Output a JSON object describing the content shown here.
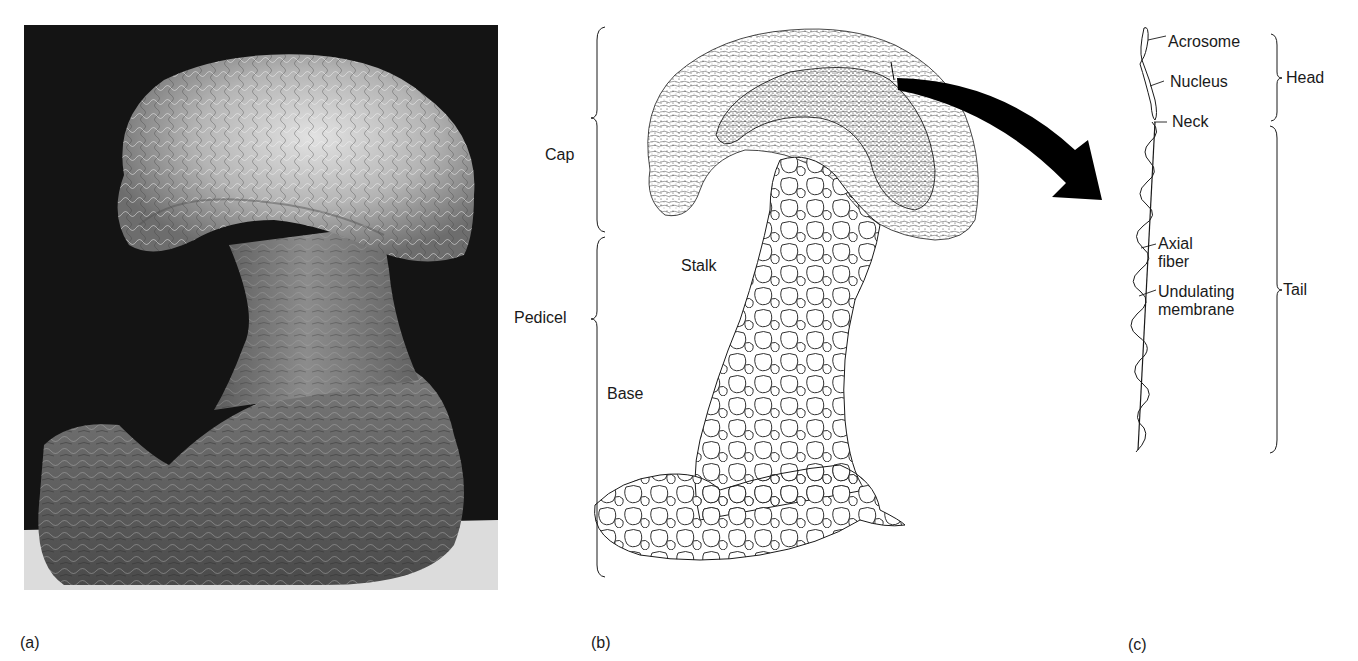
{
  "figure": {
    "panels": [
      {
        "id": "a",
        "letter": "(a)",
        "kind": "scanning electron micrograph",
        "colors": {
          "background": "#141414",
          "specimen_light": "#d8d8d8",
          "specimen_mid": "#8a8a8a",
          "substrate": "#e6e6e6"
        }
      },
      {
        "id": "b",
        "letter": "(b)",
        "kind": "line drawing",
        "bracket_labels": [
          {
            "label": "Cap"
          },
          {
            "label": "Pedicel"
          }
        ],
        "part_labels": [
          {
            "label": "Stalk"
          },
          {
            "label": "Base"
          }
        ]
      },
      {
        "id": "c",
        "letter": "(c)",
        "kind": "line drawing",
        "part_labels": [
          {
            "label": "Acrosome"
          },
          {
            "label": "Nucleus"
          },
          {
            "label": "Neck"
          },
          {
            "label": "Axial fiber",
            "lines": [
              "Axial",
              "fiber"
            ]
          },
          {
            "label": "Undulating membrane",
            "lines": [
              "Undulating",
              "membrane"
            ]
          }
        ],
        "bracket_labels": [
          {
            "label": "Head"
          },
          {
            "label": "Tail"
          }
        ]
      }
    ],
    "arrow": {
      "from": "b",
      "to": "c",
      "color": "#000000"
    }
  }
}
